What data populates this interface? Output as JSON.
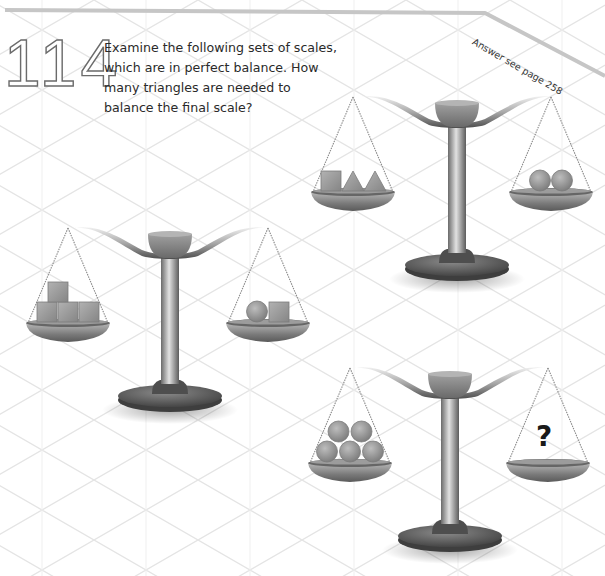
{
  "puzzle": {
    "number": "114",
    "question": "Examine the following sets of scales, which are in perfect balance. How many triangles are needed to balance the final scale?",
    "answer_reference": "Answer see page 258"
  },
  "scales": [
    {
      "id": "scale-1",
      "position": "top-right",
      "left_pan": [
        "square",
        "triangle",
        "triangle"
      ],
      "right_pan": [
        "circle",
        "circle"
      ]
    },
    {
      "id": "scale-2",
      "position": "middle-left",
      "left_pan": [
        "square",
        "square",
        "square",
        "square"
      ],
      "right_pan": [
        "circle",
        "square"
      ]
    },
    {
      "id": "scale-3",
      "position": "bottom-right",
      "left_pan": [
        "circle",
        "circle",
        "circle",
        "circle",
        "circle"
      ],
      "right_pan": [
        "unknown"
      ],
      "unknown_symbol": "?"
    }
  ],
  "colors": {
    "grid_line": "#e6e6e6",
    "border_line": "#c8c8c8",
    "metal_dark": "#5a5a5a",
    "metal_mid": "#8e8e8e",
    "metal_light": "#d8d8d8",
    "shape_fill": "#9a9a9a",
    "text": "#2a2a2a"
  }
}
